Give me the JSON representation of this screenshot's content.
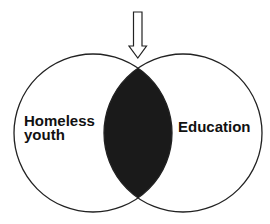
{
  "diagram": {
    "type": "venn",
    "sets": [
      {
        "label_line1": "Homeless",
        "label_line2": "youth"
      },
      {
        "label": "Education"
      }
    ],
    "intersection_fill": "#1a1a1a",
    "stroke_color": "#222222",
    "pointer": "down-arrow pointing to intersection"
  }
}
